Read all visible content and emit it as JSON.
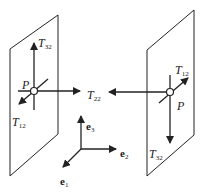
{
  "diagram": {
    "title": "",
    "colors": {
      "line": "#222222",
      "background": "#ffffff",
      "point_fill": "#ffffff"
    },
    "left_plane": {
      "point_label": "P",
      "labels": {
        "t32": {
          "base": "T",
          "sub": "32"
        },
        "t12": {
          "base": "T",
          "sub": "12"
        },
        "t22": {
          "base": "T",
          "sub": "22"
        }
      }
    },
    "right_plane": {
      "point_label": "P",
      "labels": {
        "t12": {
          "base": "T",
          "sub": "12"
        },
        "t32": {
          "base": "T",
          "sub": "32"
        }
      }
    },
    "axes": {
      "e1": {
        "base": "e",
        "sub": "1"
      },
      "e2": {
        "base": "e",
        "sub": "2"
      },
      "e3": {
        "base": "e",
        "sub": "3"
      }
    }
  }
}
